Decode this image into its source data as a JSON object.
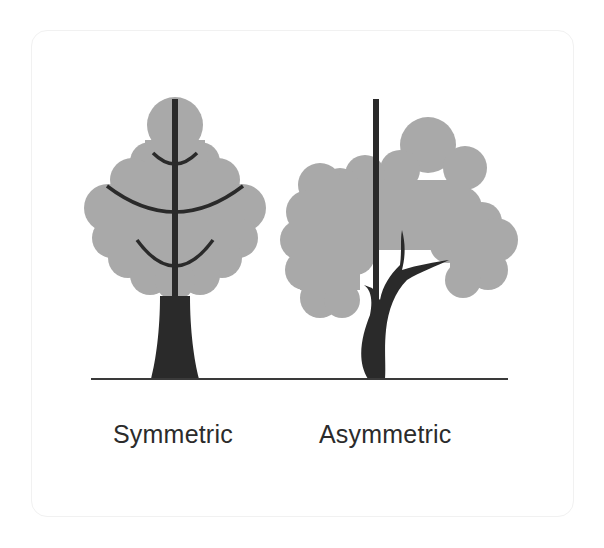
{
  "figure": {
    "labels": {
      "symmetric": "Symmetric",
      "asymmetric": "Asymmetric"
    },
    "colors": {
      "foliage": "#a9a9a9",
      "trunk": "#2a2a2a",
      "ground": "#3a3a3a",
      "text": "#2b2b2b",
      "card_border": "#f1f1f1"
    }
  }
}
